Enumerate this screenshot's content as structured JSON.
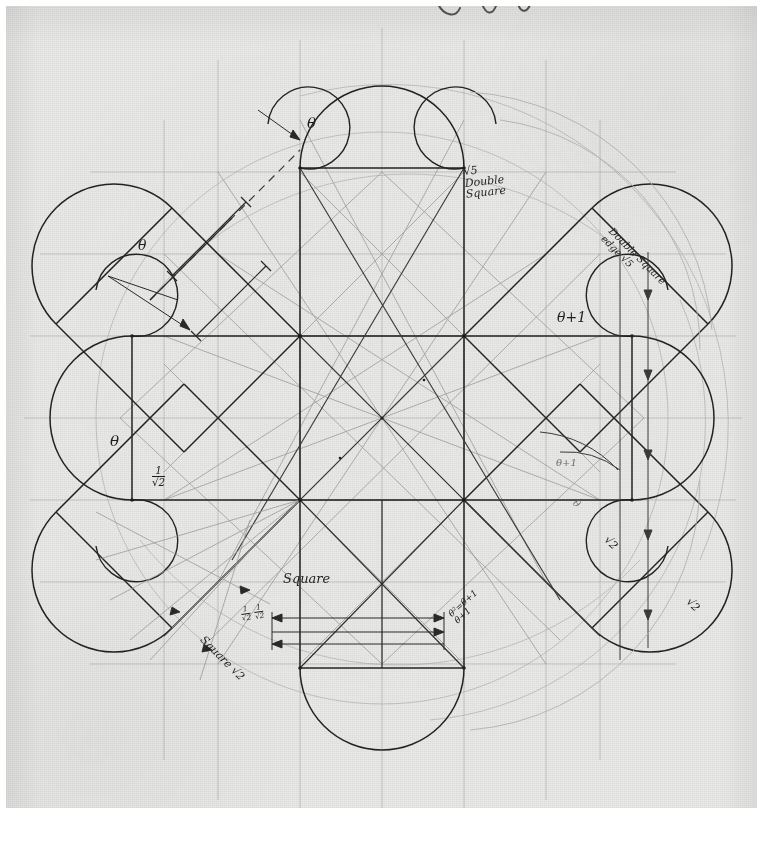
{
  "figure": {
    "kind": "hand-drawn pencil geometric construction",
    "medium": "pencil on textured paper, photocopied / scanned",
    "paper_color": "#e9e9e7",
    "ink_color": "#1f1f1f",
    "faint_ink_color": "#8d8d8e"
  },
  "labels": {
    "theta_top": "θ",
    "theta_upper_left": "θ",
    "theta_left": "θ",
    "theta_plus_one_right": "θ+1",
    "theta_plus_one_lower_right": "θ+1",
    "root5_line1": "√5",
    "root5_line2": "Double",
    "root5_line3": "Square",
    "double_square_edge_line1": "Double Square",
    "double_square_edge_line2": "edge √5",
    "square": "Square",
    "square_root2": "Square √2",
    "one_over_root2_num": "1",
    "one_over_root2_den": "√2",
    "half_root2_a_num": "1",
    "half_root2_a_den": "√2",
    "half_root2_b_num": "1",
    "half_root2_b_den": "√2",
    "theta_sq_line1": "θ²=θ+1",
    "theta_sq_line2": "θ+1",
    "theta_diag_right": "θ",
    "root2_right_upper": "√2",
    "root2_right_lower": "√2"
  },
  "geometry": {
    "center": [
      382,
      418
    ],
    "square_half": 82,
    "arm_length": 168,
    "cap_radius": 82,
    "note": "central square side 164px; four orthogonal arms and four diagonal arms of double-square proportion"
  }
}
